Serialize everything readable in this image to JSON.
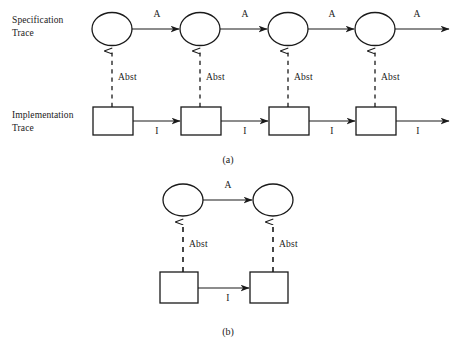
{
  "figure": {
    "title_a": "(a)",
    "title_b": "(b)",
    "row_labels": {
      "specification": "Specification\nTrace",
      "implementation": "Implementation\nTrace"
    },
    "labels": {
      "spec_transition": "A",
      "impl_transition": "I",
      "abstraction": "Abst"
    },
    "colors": {
      "stroke": "#1a1a1a",
      "background": "#ffffff",
      "text": "#1a1a1a"
    }
  },
  "panel_a": {
    "caption": "(a)",
    "spec_row_label": "Specification\nTrace",
    "impl_row_label": "Implementation\nTrace",
    "spec_states": [
      {
        "id": "s1",
        "shape": "circle",
        "cx": 112,
        "cy": 29
      },
      {
        "id": "s2",
        "shape": "circle",
        "cx": 200,
        "cy": 29
      },
      {
        "id": "s3",
        "shape": "circle",
        "cx": 288,
        "cy": 29
      },
      {
        "id": "s4",
        "shape": "circle",
        "cx": 375,
        "cy": 29
      }
    ],
    "impl_states": [
      {
        "id": "i1",
        "shape": "square",
        "cx": 113,
        "cy": 121
      },
      {
        "id": "i2",
        "shape": "square",
        "cx": 201,
        "cy": 121
      },
      {
        "id": "i3",
        "shape": "square",
        "cx": 289,
        "cy": 121
      },
      {
        "id": "i4",
        "shape": "square",
        "cx": 376,
        "cy": 121
      }
    ],
    "spec_transitions": [
      {
        "label": "A",
        "x": 156,
        "y": 14
      },
      {
        "label": "A",
        "x": 244,
        "y": 14
      },
      {
        "label": "A",
        "x": 331,
        "y": 14
      },
      {
        "label": "A",
        "x": 416,
        "y": 14
      }
    ],
    "impl_transitions": [
      {
        "label": "I",
        "x": 157,
        "y": 131
      },
      {
        "label": "I",
        "x": 245,
        "y": 131
      },
      {
        "label": "I",
        "x": 332,
        "y": 131
      },
      {
        "label": "I",
        "x": 418,
        "y": 131
      }
    ],
    "abstraction_links": [
      {
        "label": "Abst",
        "x": 118,
        "y": 72
      },
      {
        "label": "Abst",
        "x": 206,
        "y": 72
      },
      {
        "label": "Abst",
        "x": 294,
        "y": 72
      },
      {
        "label": "Abst",
        "x": 381,
        "y": 72
      }
    ]
  },
  "panel_b": {
    "caption": "(b)",
    "spec_states": [
      {
        "id": "s1",
        "shape": "circle",
        "cx": 183,
        "cy": 200
      },
      {
        "id": "s2",
        "shape": "circle",
        "cx": 273,
        "cy": 200
      }
    ],
    "impl_states": [
      {
        "id": "i1",
        "shape": "square",
        "cx": 179,
        "cy": 288
      },
      {
        "id": "i2",
        "shape": "square",
        "cx": 269,
        "cy": 288
      }
    ],
    "spec_transitions": [
      {
        "label": "A",
        "x": 228,
        "y": 185
      }
    ],
    "impl_transitions": [
      {
        "label": "I",
        "x": 228,
        "y": 297
      }
    ],
    "abstraction_links": [
      {
        "label": "Abst",
        "x": 189,
        "y": 245
      },
      {
        "label": "Abst",
        "x": 279,
        "y": 245
      }
    ]
  }
}
